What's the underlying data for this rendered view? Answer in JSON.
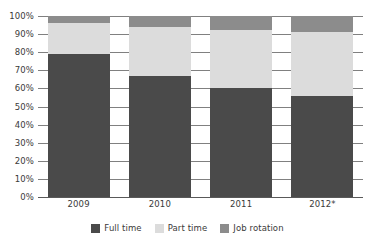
{
  "chart_data": {
    "type": "bar",
    "subtype": "stacked-100-percent",
    "title": "",
    "xlabel": "",
    "ylabel": "",
    "ylim": [
      0,
      100
    ],
    "y_unit": "%",
    "grid": true,
    "legend_position": "bottom",
    "categories": [
      "2009",
      "2010",
      "2011",
      "2012*"
    ],
    "series": [
      {
        "name": "Full time",
        "color": "#4a4a4a",
        "values": [
          79,
          67,
          60,
          56
        ]
      },
      {
        "name": "Part time",
        "color": "#dcdcdc",
        "values": [
          17,
          27,
          32,
          35
        ]
      },
      {
        "name": "Job rotation",
        "color": "#8c8c8c",
        "values": [
          4,
          6,
          8,
          9
        ]
      }
    ],
    "y_ticks": [
      {
        "value": 0,
        "label": "0%"
      },
      {
        "value": 10,
        "label": "10%"
      },
      {
        "value": 20,
        "label": "20%"
      },
      {
        "value": 30,
        "label": "30%"
      },
      {
        "value": 40,
        "label": "40%"
      },
      {
        "value": 50,
        "label": "50%"
      },
      {
        "value": 60,
        "label": "60%"
      },
      {
        "value": 70,
        "label": "70%"
      },
      {
        "value": 80,
        "label": "80%"
      },
      {
        "value": 90,
        "label": "90%"
      },
      {
        "value": 100,
        "label": "100%"
      }
    ],
    "legend": [
      {
        "label": "Full time",
        "color": "#4a4a4a"
      },
      {
        "label": "Part time",
        "color": "#dcdcdc"
      },
      {
        "label": "Job rotation",
        "color": "#8c8c8c"
      }
    ],
    "colors": {
      "gridline": "#808080",
      "axis": "#595959",
      "text": "#3a3a3a",
      "background": "#ffffff"
    }
  }
}
